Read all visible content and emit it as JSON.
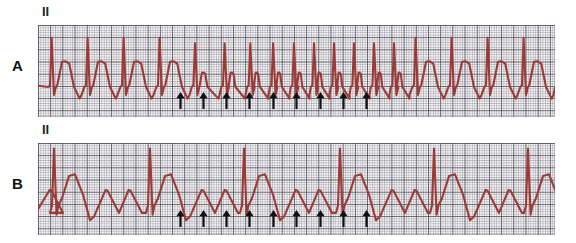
{
  "figure": {
    "background_color": "#ffffff",
    "trace_color": "#9c3a38",
    "grid_color": "#787887",
    "grid_bold_color": "#464650",
    "arrow_color": "#111111",
    "width": 576,
    "height": 243
  },
  "panels": [
    {
      "letter": "A",
      "lead_label": "II",
      "description": "Atrial flutter with variable / rapid ventricular response",
      "strip": {
        "x": 38,
        "y": 25,
        "width": 517,
        "height": 92
      },
      "letter_pos": {
        "x": 12,
        "y": 58
      },
      "lead_pos": {
        "x": 42,
        "y": 5
      },
      "arrow_label": "flutter-wave-marker",
      "arrow_count": 9,
      "arrow_x": [
        180,
        203,
        226,
        249,
        273,
        296,
        320,
        343,
        366
      ],
      "arrow_y": 92,
      "qrs_count": 16,
      "qrs_x": [
        48,
        72,
        96,
        120,
        144,
        168,
        192,
        216,
        240,
        264,
        288,
        312,
        336,
        372,
        408,
        444,
        480,
        516,
        549
      ]
    },
    {
      "letter": "B",
      "lead_label": "II",
      "description": "Atrial flutter with slower ventricular response, sawtooth flutter waves visible",
      "strip": {
        "x": 38,
        "y": 143,
        "width": 517,
        "height": 92
      },
      "letter_pos": {
        "x": 12,
        "y": 176
      },
      "lead_pos": {
        "x": 42,
        "y": 123
      },
      "arrow_label": "flutter-wave-marker",
      "arrow_count": 9,
      "arrow_x": [
        180,
        203,
        226,
        249,
        273,
        296,
        320,
        343,
        366
      ],
      "arrow_y": 210,
      "qrs_count": 6,
      "qrs_x": [
        52,
        148,
        240,
        338,
        430,
        522
      ]
    }
  ],
  "chart_data": {
    "type": "line",
    "xlabel": "",
    "ylabel": "",
    "grid": true,
    "legend": "none",
    "series": [
      {
        "name": "A",
        "lead": "II",
        "description": "Rapid irregular ventricular response; tall narrow QRS spikes with large P/T deflections at left, narrowing complexes in mid-strip, wide complexes at right",
        "qrs_positions": [
          48,
          72,
          96,
          120,
          144,
          168,
          192,
          216,
          240,
          264,
          288,
          312,
          336,
          372,
          408,
          444,
          480,
          516,
          549
        ],
        "marker_positions": [
          180,
          203,
          226,
          249,
          273,
          296,
          320,
          343,
          366
        ]
      },
      {
        "name": "B",
        "lead": "II",
        "description": "Slow ventricular response with continuous sawtooth atrial flutter waves between QRS complexes",
        "qrs_positions": [
          52,
          148,
          240,
          338,
          430,
          522
        ],
        "marker_positions": [
          180,
          203,
          226,
          249,
          273,
          296,
          320,
          343,
          366
        ]
      }
    ]
  }
}
